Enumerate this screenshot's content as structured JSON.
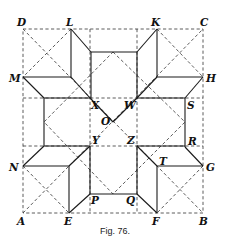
{
  "figure": {
    "caption": "Fig. 76.",
    "points": {
      "A": "A",
      "B": "B",
      "C": "C",
      "D": "D",
      "E": "E",
      "F": "F",
      "G": "G",
      "H": "H",
      "K": "K",
      "L": "L",
      "M": "M",
      "N": "N",
      "O": "O",
      "P": "P",
      "Q": "Q",
      "R": "R",
      "S": "S",
      "T": "T",
      "W": "W",
      "X": "X",
      "Y": "Y",
      "Z": "Z"
    },
    "colors": {
      "ink": "#1a1a1a",
      "background": "#ffffff"
    }
  }
}
